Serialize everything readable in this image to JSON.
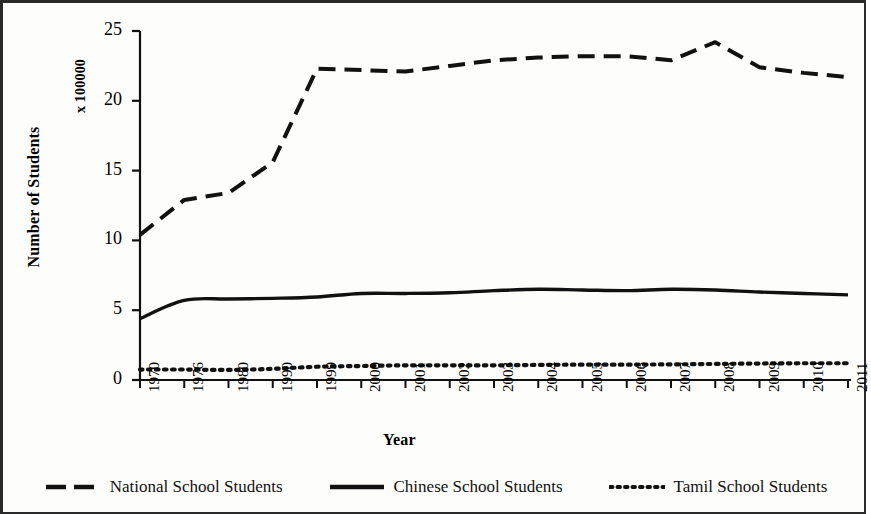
{
  "chart_data": {
    "type": "line",
    "title": "",
    "xlabel": "Year",
    "ylabel": "Number of Students",
    "yunit": "x 100000",
    "ylim": [
      0,
      25
    ],
    "yticks": [
      0,
      5,
      10,
      15,
      20,
      25
    ],
    "grid": false,
    "legend_position": "bottom",
    "categories": [
      "1970",
      "1976",
      "1980",
      "1990",
      "1999",
      "2000",
      "2001",
      "2002",
      "2003",
      "2004",
      "2005",
      "2006",
      "2007",
      "2008",
      "2009",
      "2010",
      "2011"
    ],
    "series": [
      {
        "name": "National School Students",
        "style": "dashed",
        "color": "#111111",
        "values": [
          10.4,
          12.9,
          13.4,
          15.6,
          22.3,
          22.2,
          22.1,
          22.5,
          22.9,
          23.1,
          23.2,
          23.2,
          22.9,
          24.2,
          22.4,
          22.0,
          21.7
        ]
      },
      {
        "name": "Chinese School Students",
        "style": "solid",
        "color": "#111111",
        "values": [
          4.4,
          5.7,
          5.8,
          5.85,
          5.95,
          6.2,
          6.2,
          6.25,
          6.4,
          6.5,
          6.45,
          6.4,
          6.5,
          6.45,
          6.3,
          6.2,
          6.1
        ]
      },
      {
        "name": "Tamil School Students",
        "style": "dotted",
        "color": "#111111",
        "values": [
          0.75,
          0.75,
          0.72,
          0.8,
          0.95,
          1.0,
          1.05,
          1.05,
          1.05,
          1.08,
          1.1,
          1.1,
          1.12,
          1.15,
          1.18,
          1.2,
          1.2
        ]
      }
    ]
  },
  "axes": {
    "y_title": "Number of Students",
    "y_unit": "x 100000",
    "x_title": "Year"
  },
  "legend": {
    "items": [
      {
        "label": "National School Students",
        "style": "dashed"
      },
      {
        "label": "Chinese School Students",
        "style": "solid"
      },
      {
        "label": "Tamil School Students",
        "style": "dotted"
      }
    ]
  }
}
